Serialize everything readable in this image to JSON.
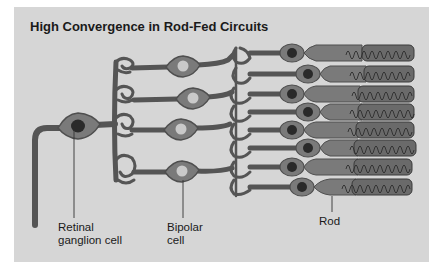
{
  "title": "High Convergence in Rod-Fed Circuits",
  "labels": {
    "ganglion": "Retinal\nganglion cell",
    "ganglion_line1": "Retinal",
    "ganglion_line2": "ganglion cell",
    "bipolar_line1": "Bipolar",
    "bipolar_line2": "cell",
    "rod": "Rod"
  },
  "colors": {
    "panel": "#d6d6d6",
    "cell_body": "#7a7a7a",
    "cell_outline": "#4f4f4f",
    "nucleus_dark": "#2a2a2a",
    "nucleus_light": "#c9c9c9",
    "outer_segment": "#6a6a6a",
    "text": "#1a1a1a"
  },
  "diagram": {
    "ganglion_cells": 1,
    "bipolar_cells": 4,
    "rods": 8
  }
}
